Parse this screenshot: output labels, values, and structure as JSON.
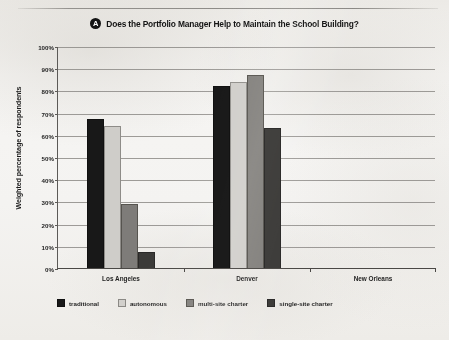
{
  "figure": {
    "badge_letter": "A",
    "title": "Does the Portfolio Manager Help to Maintain the School Building?"
  },
  "chart_data": {
    "type": "bar",
    "title": "Does the Portfolio Manager Help to Maintain the School Building?",
    "xlabel": "",
    "ylabel": "Weighted percentage of respondents",
    "ylim": [
      0,
      100
    ],
    "ytick_labels": [
      "100%",
      "90%",
      "80%",
      "70%",
      "60%",
      "50%",
      "40%",
      "30%",
      "20%",
      "10%",
      "0%"
    ],
    "ytick_values": [
      100,
      90,
      80,
      70,
      60,
      50,
      40,
      30,
      20,
      10,
      0
    ],
    "grid": true,
    "legend_position": "bottom-left",
    "categories": [
      "Los Angeles",
      "Denver",
      "New Orleans"
    ],
    "series": [
      {
        "name": "traditional",
        "color": "#181818",
        "values": [
          67,
          82,
          null
        ]
      },
      {
        "name": "autonomous",
        "color": "#cfcdc9",
        "values": [
          64,
          84,
          null
        ]
      },
      {
        "name": "multi-site charter",
        "color": "#7e7c79",
        "values": [
          29,
          87,
          null
        ]
      },
      {
        "name": "single-site charter",
        "color": "#3b3a38",
        "values": [
          7,
          63,
          null
        ]
      }
    ]
  }
}
